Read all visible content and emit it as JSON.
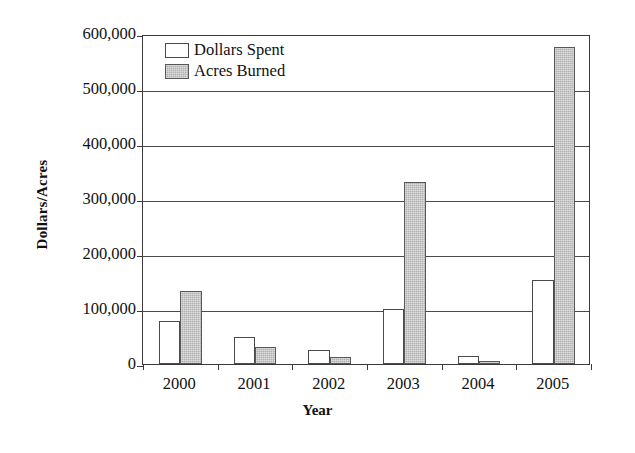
{
  "chart_data": {
    "type": "bar",
    "title": "",
    "xlabel": "Year",
    "ylabel": "Dollars/Acres",
    "categories": [
      "2000",
      "2001",
      "2002",
      "2003",
      "2004",
      "2005"
    ],
    "series": [
      {
        "name": "Dollars Spent",
        "color": "#ffffff",
        "values": [
          78000,
          50000,
          25000,
          100000,
          15000,
          153000
        ]
      },
      {
        "name": "Acres Burned",
        "color": "#b0b0b0",
        "values": [
          133000,
          31000,
          12000,
          331000,
          6000,
          576000
        ]
      }
    ],
    "ylim": [
      0,
      600000
    ],
    "yticks": [
      0,
      100000,
      200000,
      300000,
      400000,
      500000,
      600000
    ],
    "ytick_labels": [
      "0",
      "100,000",
      "200,000",
      "300,000",
      "400,000",
      "500,000",
      "600,000"
    ],
    "grid": "horizontal",
    "legend_position": "top-left-inside",
    "legend": [
      {
        "label": "Dollars Spent",
        "swatch": "white-square"
      },
      {
        "label": "Acres Burned",
        "swatch": "gray-square"
      }
    ]
  }
}
